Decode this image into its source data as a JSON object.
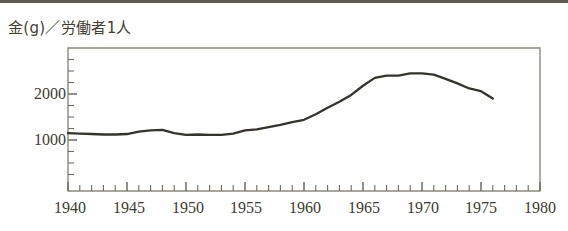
{
  "figure": {
    "title": "金(g)／労働者1人",
    "title_semantic": "gold-grams-per-worker"
  },
  "chart_data": {
    "type": "line",
    "title": "金(g)／労働者1人",
    "xlabel": "",
    "ylabel": "金(g)／労働者1人",
    "xlim": [
      1940,
      1980
    ],
    "ylim": [
      0,
      3000
    ],
    "grid": false,
    "legend": null,
    "x_ticks_major": [
      1940,
      1945,
      1950,
      1955,
      1960,
      1965,
      1970,
      1975,
      1980
    ],
    "x_tick_labels": [
      "1940",
      "1945",
      "1950",
      "1955",
      "1960",
      "1965",
      "1970",
      "1975",
      "1980"
    ],
    "x_tick_minor_step": 1,
    "y_ticks_major": [
      1000,
      2000
    ],
    "y_tick_labels": [
      "1000",
      "2000"
    ],
    "y_tick_minor_step": 250,
    "series": [
      {
        "name": "金(g)／労働者1人",
        "x": [
          1940,
          1941,
          1942,
          1943,
          1944,
          1945,
          1946,
          1947,
          1948,
          1949,
          1950,
          1951,
          1952,
          1953,
          1954,
          1955,
          1956,
          1957,
          1958,
          1959,
          1960,
          1961,
          1962,
          1963,
          1964,
          1965,
          1966,
          1967,
          1968,
          1969,
          1970,
          1971,
          1972,
          1973,
          1974,
          1975,
          1976
        ],
        "values": [
          1150,
          1140,
          1130,
          1120,
          1120,
          1130,
          1180,
          1210,
          1220,
          1150,
          1110,
          1120,
          1110,
          1110,
          1140,
          1210,
          1230,
          1280,
          1330,
          1390,
          1440,
          1560,
          1700,
          1830,
          1980,
          2180,
          2350,
          2400,
          2400,
          2450,
          2450,
          2420,
          2330,
          2230,
          2120,
          2060,
          1900
        ]
      }
    ]
  },
  "axes": {
    "y_labels": [
      "2000",
      "1000"
    ],
    "x_labels": [
      "1940",
      "1945",
      "1950",
      "1955",
      "1960",
      "1965",
      "1970",
      "1975",
      "1980"
    ]
  }
}
